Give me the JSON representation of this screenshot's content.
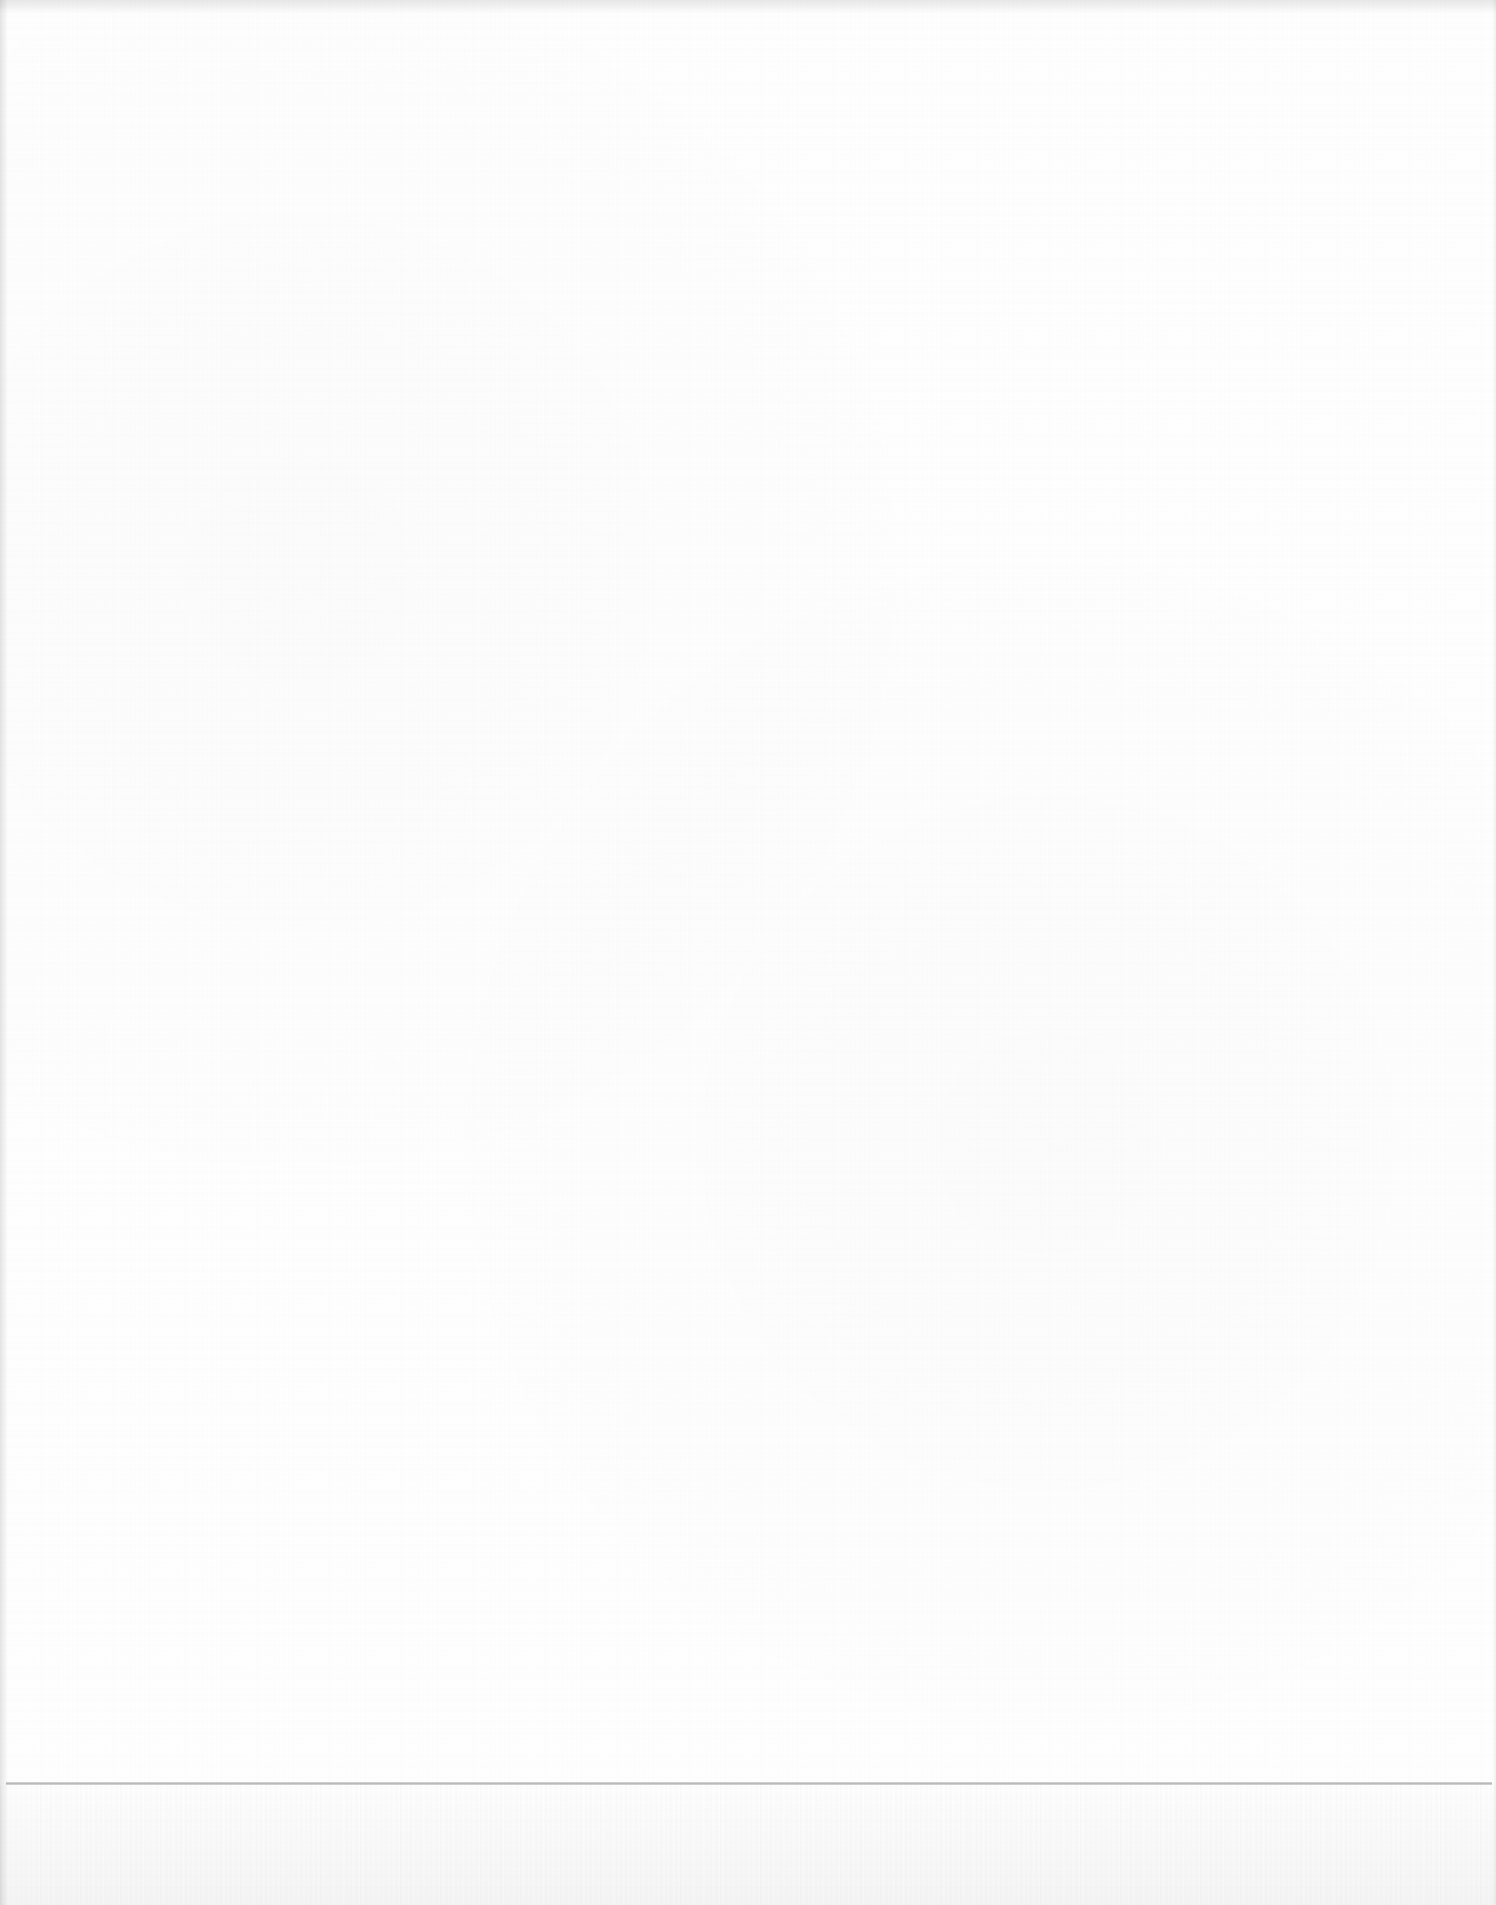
{
  "document": {
    "type": "blank-scanned-page",
    "text_content": [],
    "colors": {
      "paper": "#fefefe",
      "rule": "#9a9a9a",
      "edge_shadow": "#e6e6e6"
    }
  }
}
